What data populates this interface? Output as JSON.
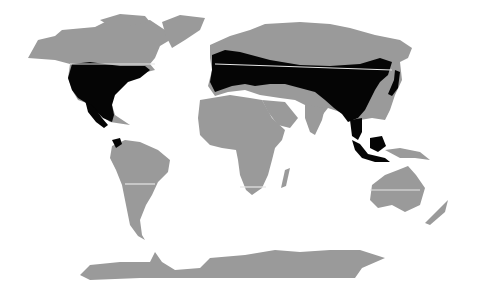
{
  "map": {
    "type": "world distribution map",
    "projection": "cylindrical (Robinson-like)",
    "colors": {
      "background": "#ffffff",
      "land": "#9a9a9a",
      "range": "#050505",
      "latitude_lines": "#e6e6e6"
    },
    "legend": null,
    "highlighted_regions": [
      "North America (USA, southern Canada, Mexico, Central America)",
      "Northwestern South America",
      "Europe",
      "Central Asia / Southern Siberia",
      "East Asia (China, Korea, Japan)",
      "Southeast Asia (Indochina, Malaysia, Indonesia, Borneo)"
    ],
    "reference_lines": [
      "northern latitude line",
      "southern latitude line"
    ]
  }
}
